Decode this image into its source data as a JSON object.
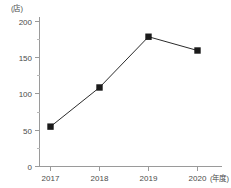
{
  "chart_data": {
    "type": "line",
    "title": "",
    "subtitle": "",
    "xlabel": "(年度)",
    "ylabel": "(店)",
    "categories": [
      "2017",
      "2018",
      "2019",
      "2020"
    ],
    "values": [
      55,
      109,
      179,
      160
    ],
    "series": [
      {
        "name": "",
        "values": [
          55,
          109,
          179,
          160
        ]
      }
    ],
    "ylim": [
      0,
      200
    ],
    "ytick_labels": [
      "0",
      "50",
      "100",
      "150",
      "200"
    ],
    "ytick_values": [
      0,
      50,
      100,
      150,
      200
    ],
    "yminor_tick_values": [
      25,
      75,
      125,
      175
    ],
    "xtick_labels": [
      "2017",
      "2018",
      "2019",
      "2020"
    ],
    "grid": false,
    "legend": false,
    "legend_position": "none",
    "marker": "filled-square",
    "line_color": "#2b2b2b",
    "marker_color": "#1a1a1a",
    "axis_color": "#9a9a9a",
    "text_color": "#4a4a4a",
    "background_color": "#ffffff"
  },
  "axis": {
    "y_unit_label": "(店)",
    "x_unit_label": "(年度)"
  }
}
